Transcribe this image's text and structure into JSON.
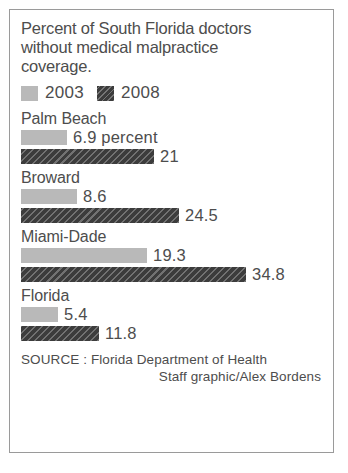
{
  "chart_data": {
    "type": "bar",
    "title": "Percent of South Florida doctors without medical malpractice coverage.",
    "title_lines": [
      "Percent of South Florida doctors",
      "without medical malpractice",
      "coverage."
    ],
    "orientation": "horizontal",
    "grid": false,
    "legend_position": "top",
    "xlabel": "",
    "ylabel": "",
    "xlim": [
      0,
      34.8
    ],
    "categories": [
      "Palm Beach",
      "Broward",
      "Miami-Dade",
      "Florida"
    ],
    "series": [
      {
        "name": "2003",
        "color": "#b9b9b9",
        "values": [
          6.9,
          8.6,
          19.3,
          5.4
        ]
      },
      {
        "name": "2008",
        "color": "#3c3c3c",
        "values": [
          21,
          24.5,
          34.8,
          11.8
        ]
      }
    ],
    "groups": [
      {
        "label": "Palm Beach",
        "bars": [
          {
            "series": "2003",
            "value": 6.9,
            "value_label": "6.9 percent",
            "length_px": 46
          },
          {
            "series": "2008",
            "value": 21,
            "value_label": "21",
            "length_px": 133
          }
        ]
      },
      {
        "label": "Broward",
        "bars": [
          {
            "series": "2003",
            "value": 8.6,
            "value_label": "8.6",
            "length_px": 56
          },
          {
            "series": "2008",
            "value": 24.5,
            "value_label": "24.5",
            "length_px": 158
          }
        ]
      },
      {
        "label": "Miami-Dade",
        "bars": [
          {
            "series": "2003",
            "value": 19.3,
            "value_label": "19.3",
            "length_px": 126
          },
          {
            "series": "2008",
            "value": 34.8,
            "value_label": "34.8",
            "length_px": 225
          }
        ]
      },
      {
        "label": "Florida",
        "bars": [
          {
            "series": "2003",
            "value": 5.4,
            "value_label": "5.4",
            "length_px": 37
          },
          {
            "series": "2008",
            "value": 11.8,
            "value_label": "11.8",
            "length_px": 78
          }
        ]
      }
    ],
    "legend": [
      {
        "label": "2003",
        "swatch": "light-gray-swatch"
      },
      {
        "label": "2008",
        "swatch": "dark-hatched-swatch"
      }
    ],
    "source_lines": [
      "SOURCE : Florida Department of Health",
      "Staff graphic/Alex Bordens"
    ]
  }
}
